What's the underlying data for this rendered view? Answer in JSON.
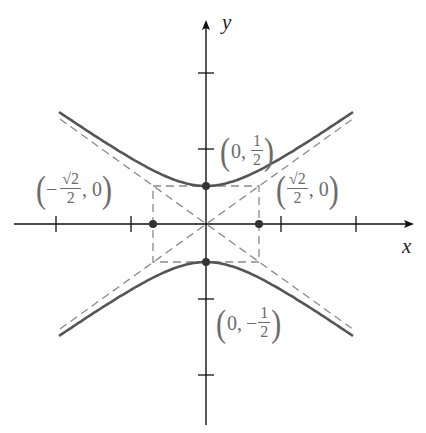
{
  "figure": {
    "type": "hyperbola",
    "equation": "y^2/(1/4) - x^2/(1/2) = 1",
    "axes": {
      "x_label": "x",
      "y_label": "y"
    },
    "vertices": [
      {
        "label_prefix": "0,",
        "sign": "",
        "num": "1",
        "den": "2",
        "x": 0,
        "y": 0.5
      },
      {
        "label_prefix": "0,",
        "sign": "−",
        "num": "1",
        "den": "2",
        "x": 0,
        "y": -0.5
      }
    ],
    "co_vertices": [
      {
        "sign": "−",
        "num": "√2",
        "den": "2",
        "suffix": ", 0",
        "x": -0.7071,
        "y": 0
      },
      {
        "sign": "",
        "num": "√2",
        "den": "2",
        "suffix": ", 0",
        "x": 0.7071,
        "y": 0
      }
    ],
    "asymptotes": [
      "y = (√2/2)x",
      "y = −(√2/2)x"
    ],
    "ticks": {
      "x": [
        -2,
        -1,
        1,
        2
      ],
      "y": [
        -2,
        -1,
        1,
        2
      ]
    },
    "colors": {
      "curve": "#555555",
      "asymptote": "#8a8a8a",
      "axis": "#111111",
      "label": "#6b6b6b"
    }
  }
}
